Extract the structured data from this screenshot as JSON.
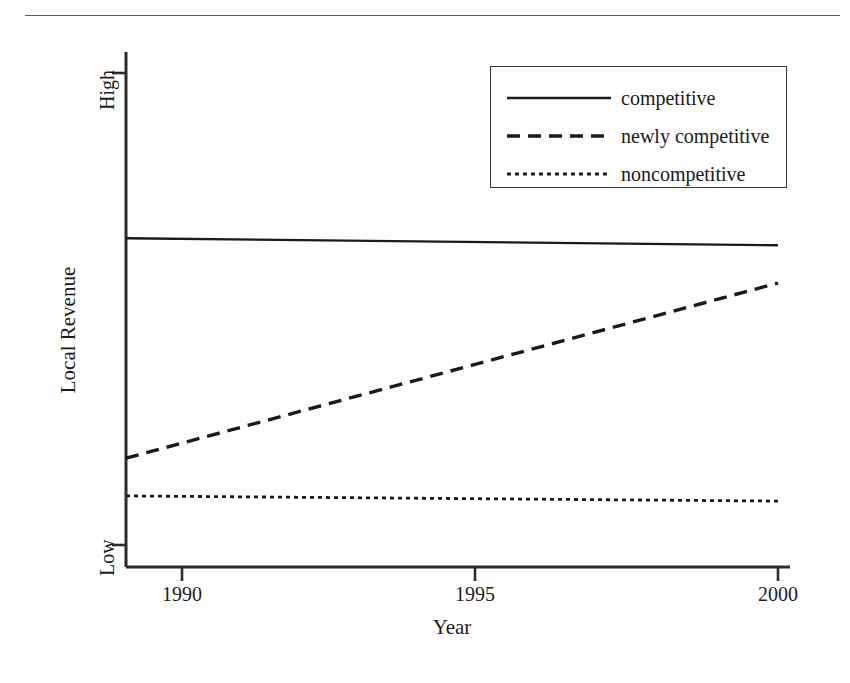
{
  "figure": {
    "has_top_rule": true,
    "background_color": "#ffffff",
    "line_color": "#1a1a1a",
    "axis_color": "#2b2b2b"
  },
  "axes": {
    "ylabel": "Local Revenue",
    "xlabel": "Year",
    "ytick_labels": [
      "Low",
      "High"
    ],
    "xtick_labels": [
      "1990",
      "1995",
      "2000"
    ]
  },
  "legend": {
    "position": "upper right",
    "entries": [
      {
        "label": "competitive",
        "style": "solid"
      },
      {
        "label": "newly competitive",
        "style": "dashed"
      },
      {
        "label": "noncompetitive",
        "style": "dotted"
      }
    ]
  },
  "chart_data": {
    "type": "line",
    "title": "",
    "xlabel": "Year",
    "ylabel": "Local Revenue",
    "xlim": [
      1989,
      2000
    ],
    "ylim": [
      0,
      1
    ],
    "xticks": [
      1990,
      1995,
      2000
    ],
    "xtick_labels": [
      "1990",
      "1995",
      "2000"
    ],
    "yticks": [
      0,
      1
    ],
    "ytick_labels": [
      "Low",
      "High"
    ],
    "grid": false,
    "legend_position": "upper right",
    "x": [
      1989,
      2000
    ],
    "series": [
      {
        "name": "competitive",
        "style": "solid",
        "color": "#1a1a1a",
        "values": [
          0.65,
          0.635
        ]
      },
      {
        "name": "newly competitive",
        "style": "dashed",
        "color": "#1a1a1a",
        "values": [
          0.184,
          0.555
        ]
      },
      {
        "name": "noncompetitive",
        "style": "dotted",
        "color": "#1a1a1a",
        "values": [
          0.104,
          0.093
        ]
      }
    ]
  }
}
